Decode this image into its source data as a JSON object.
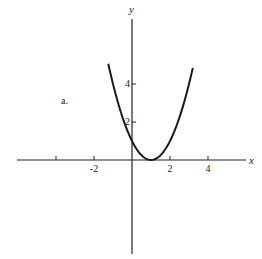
{
  "chart_data": {
    "type": "line",
    "title": "",
    "panel_label": "a.",
    "xlabel": "x",
    "ylabel": "y",
    "function": "y = (x - 1)^2",
    "x_ticks": [
      -4,
      -2,
      2,
      4
    ],
    "x_tick_labels": [
      "",
      "-2",
      "2",
      "4"
    ],
    "y_ticks": [
      2,
      4
    ],
    "y_tick_labels": [
      "2",
      "4"
    ],
    "xlim": [
      -6,
      6
    ],
    "ylim": [
      -5,
      7.9
    ],
    "grid": false,
    "legend": null,
    "series": [
      {
        "name": "parabola",
        "x": [
          -1.25,
          -1.0,
          -0.5,
          0.0,
          0.5,
          1.0,
          1.5,
          2.0,
          2.5,
          3.0,
          3.2
        ],
        "y": [
          5.06,
          4.0,
          2.25,
          1.0,
          0.25,
          0.0,
          0.25,
          1.0,
          2.25,
          4.0,
          4.84
        ]
      }
    ],
    "colors": {
      "axis": "#222222",
      "curve": "#1a1a1a"
    }
  }
}
